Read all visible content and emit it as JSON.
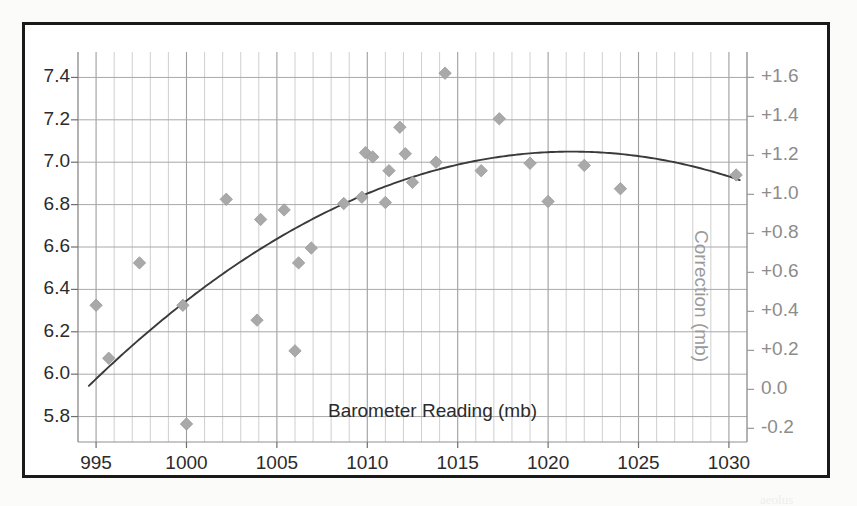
{
  "chart_data": {
    "type": "scatter",
    "title": "",
    "xlabel": "Barometer Reading (mb)",
    "ylabel": "",
    "y2label": "Correction (mb)",
    "xlim": [
      994,
      1031
    ],
    "ylim": [
      5.68,
      7.52
    ],
    "y2lim": [
      -0.27,
      1.73
    ],
    "xticks": [
      995,
      1000,
      1005,
      1010,
      1015,
      1020,
      1025,
      1030
    ],
    "xtick_labels": [
      "995",
      "1000",
      "1005",
      "1010",
      "1015",
      "1020",
      "1025",
      "1030"
    ],
    "yticks": [
      5.8,
      6.0,
      6.2,
      6.4,
      6.6,
      6.8,
      7.0,
      7.2,
      7.4
    ],
    "ytick_labels": [
      "5.8",
      "6.0",
      "6.2",
      "6.4",
      "6.6",
      "6.8",
      "7.0",
      "7.2",
      "7.4"
    ],
    "y2ticks": [
      -0.2,
      0.0,
      0.2,
      0.4,
      0.6,
      0.8,
      1.0,
      1.2,
      1.4,
      1.6
    ],
    "y2tick_labels": [
      "-0.2",
      "0.0",
      "+0.2",
      "+0.4",
      "+0.6",
      "+0.8",
      "+1.0",
      "+1.2",
      "+1.4",
      "+1.6"
    ],
    "grid": true,
    "grid_minor": true,
    "minor_x_step": 1,
    "legend": null,
    "marker": "diamond",
    "marker_color": "#a9a9a9",
    "trend_color": "#3a3a3a",
    "points": [
      {
        "x": 995.0,
        "y": 6.325
      },
      {
        "x": 995.7,
        "y": 6.075
      },
      {
        "x": 997.4,
        "y": 6.525
      },
      {
        "x": 999.8,
        "y": 6.325
      },
      {
        "x": 1000.0,
        "y": 5.765
      },
      {
        "x": 1002.2,
        "y": 6.825
      },
      {
        "x": 1003.9,
        "y": 6.255
      },
      {
        "x": 1004.1,
        "y": 6.73
      },
      {
        "x": 1005.4,
        "y": 6.775
      },
      {
        "x": 1006.0,
        "y": 6.11
      },
      {
        "x": 1006.2,
        "y": 6.525
      },
      {
        "x": 1006.9,
        "y": 6.595
      },
      {
        "x": 1008.7,
        "y": 6.805
      },
      {
        "x": 1009.7,
        "y": 6.835
      },
      {
        "x": 1009.9,
        "y": 7.045
      },
      {
        "x": 1010.3,
        "y": 7.025
      },
      {
        "x": 1011.0,
        "y": 6.81
      },
      {
        "x": 1011.2,
        "y": 6.96
      },
      {
        "x": 1011.8,
        "y": 7.165
      },
      {
        "x": 1012.1,
        "y": 7.04
      },
      {
        "x": 1012.5,
        "y": 6.905
      },
      {
        "x": 1013.8,
        "y": 7.0
      },
      {
        "x": 1014.3,
        "y": 7.42
      },
      {
        "x": 1016.3,
        "y": 6.96
      },
      {
        "x": 1017.3,
        "y": 7.205
      },
      {
        "x": 1019.0,
        "y": 6.995
      },
      {
        "x": 1020.0,
        "y": 6.815
      },
      {
        "x": 1022.0,
        "y": 6.985
      },
      {
        "x": 1024.0,
        "y": 6.875
      },
      {
        "x": 1030.4,
        "y": 6.94
      }
    ],
    "trend": {
      "type": "quadratic-fit",
      "x_start": 994.6,
      "x_end": 1030.6,
      "vertex_x": 1021.3,
      "vertex_y": 7.05,
      "y_at_start": 5.945,
      "y_at_end": 6.93
    }
  },
  "annotations": {
    "bottom_right_smudge": "aeolus",
    "bottom_left_smudge": ""
  }
}
